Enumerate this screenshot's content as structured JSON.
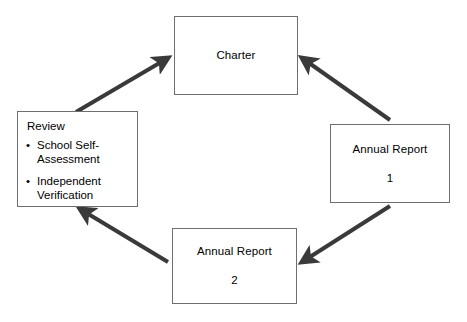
{
  "diagram": {
    "type": "cycle-flow",
    "background_color": "#ffffff",
    "box_border_color": "#6e6e6e",
    "arrow_color": "#3a3a3a",
    "nodes": [
      {
        "id": "charter",
        "title": "Charter",
        "subtitle": ""
      },
      {
        "id": "annual-report-1",
        "title": "Annual Report",
        "subtitle": "1"
      },
      {
        "id": "annual-report-2",
        "title": "Annual Report",
        "subtitle": "2"
      },
      {
        "id": "review",
        "heading": "Review",
        "bullets": [
          {
            "line1": "School Self-",
            "line2": "Assessment",
            "marker": "•"
          },
          {
            "line1": "Independent",
            "line2": "Verification",
            "marker": "•"
          }
        ]
      }
    ],
    "edges": [
      {
        "id": "review-to-charter",
        "from": "review",
        "to": "charter"
      },
      {
        "id": "charter-to-annual-report-1",
        "from": "annual-report-1",
        "to": "charter"
      },
      {
        "id": "annual-report-1-to-annual-report-2",
        "from": "annual-report-1",
        "to": "annual-report-2"
      },
      {
        "id": "annual-report-2-to-review",
        "from": "annual-report-2",
        "to": "review"
      }
    ]
  }
}
